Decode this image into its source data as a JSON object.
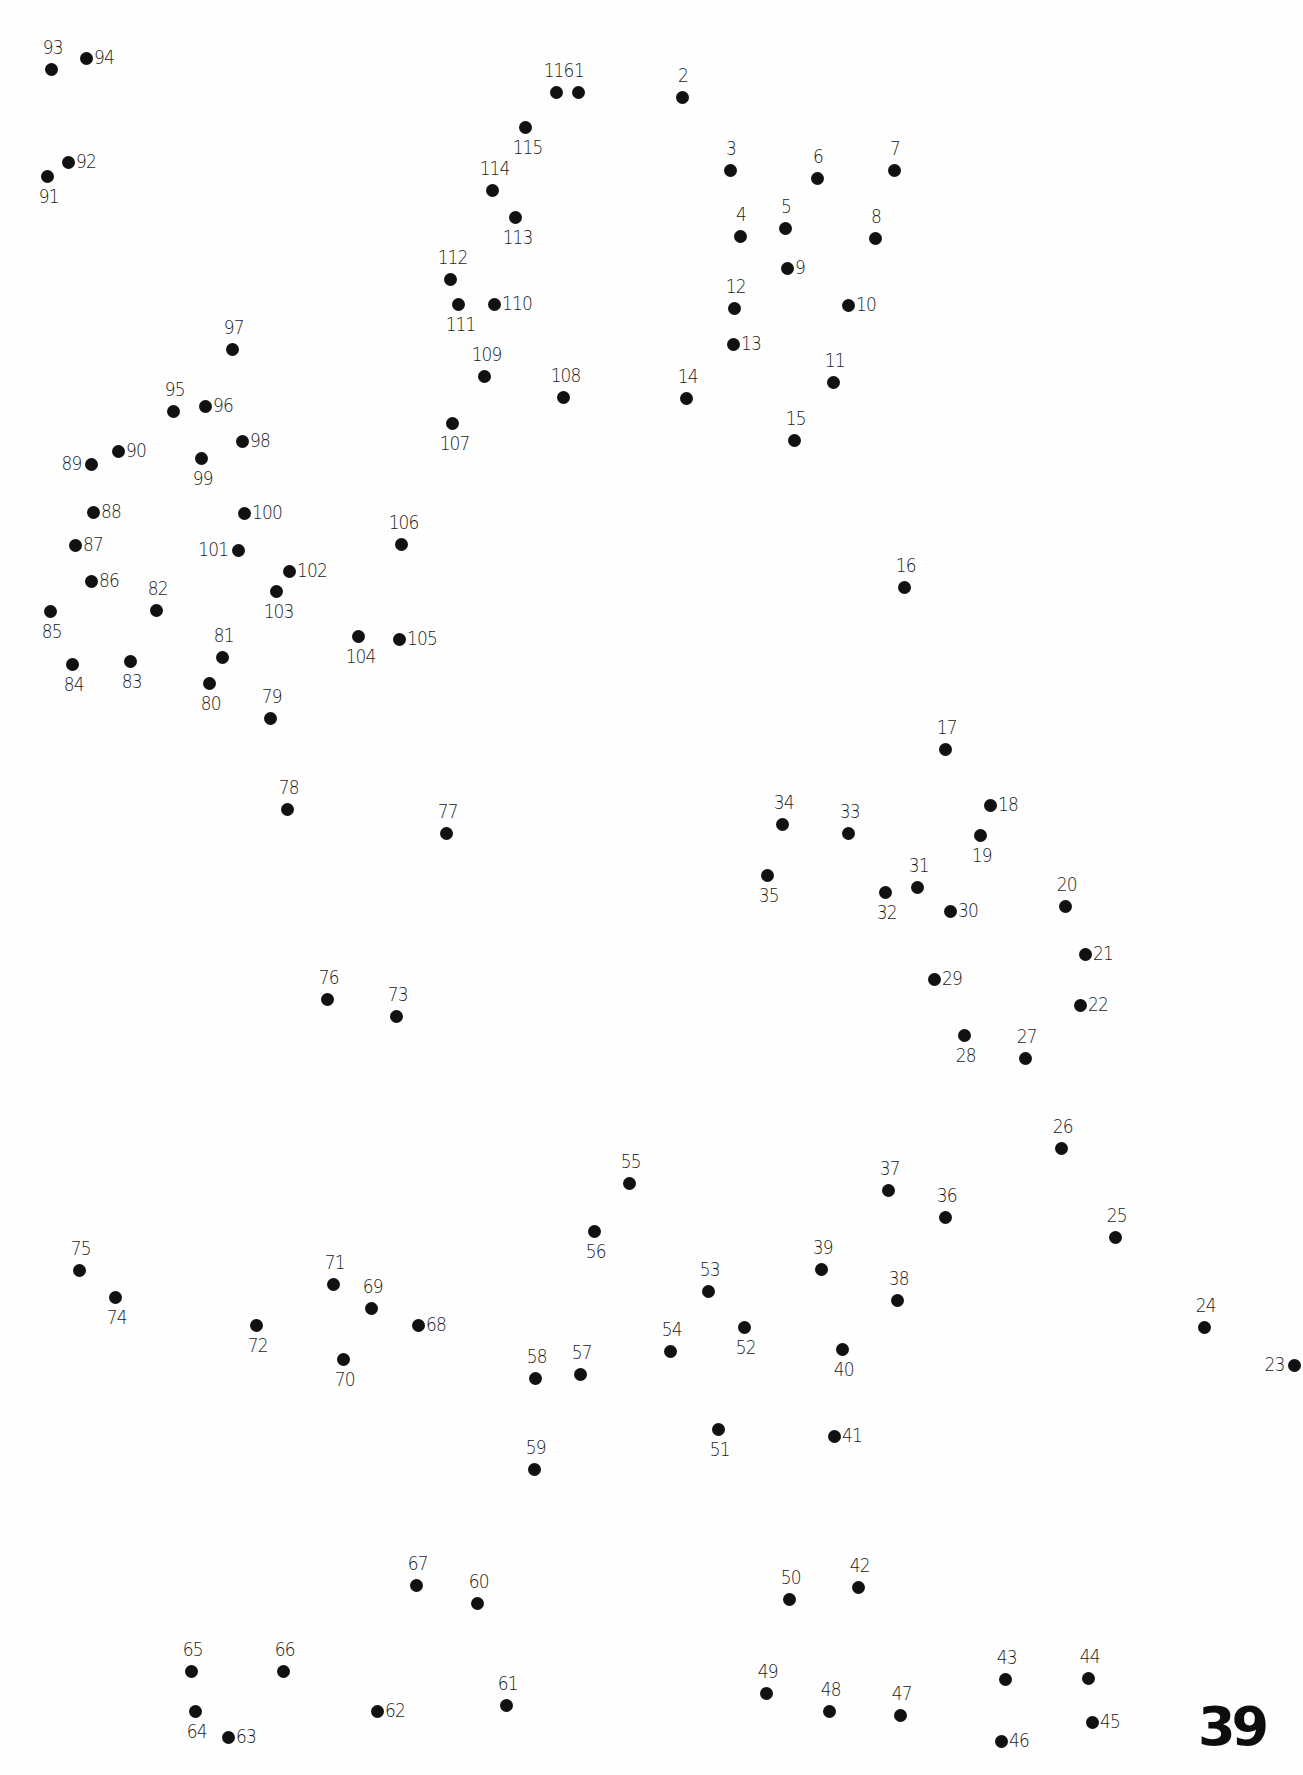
{
  "puzzle": {
    "type": "connect-the-dots",
    "page_number": "39",
    "dot_color": "#111111",
    "background_color": "#fefefe",
    "dots": [
      {
        "n": "1",
        "x": 578,
        "y": 92,
        "label_pos": "above"
      },
      {
        "n": "2",
        "x": 682,
        "y": 97,
        "label_pos": "above"
      },
      {
        "n": "3",
        "x": 730,
        "y": 170,
        "label_pos": "above"
      },
      {
        "n": "4",
        "x": 740,
        "y": 236,
        "label_pos": "above"
      },
      {
        "n": "5",
        "x": 785,
        "y": 228,
        "label_pos": "above"
      },
      {
        "n": "6",
        "x": 817,
        "y": 178,
        "label_pos": "above"
      },
      {
        "n": "7",
        "x": 894,
        "y": 170,
        "label_pos": "above"
      },
      {
        "n": "8",
        "x": 875,
        "y": 238,
        "label_pos": "above"
      },
      {
        "n": "9",
        "x": 787,
        "y": 268,
        "label_pos": "right"
      },
      {
        "n": "10",
        "x": 848,
        "y": 305,
        "label_pos": "right"
      },
      {
        "n": "11",
        "x": 833,
        "y": 382,
        "label_pos": "above"
      },
      {
        "n": "12",
        "x": 734,
        "y": 308,
        "label_pos": "above"
      },
      {
        "n": "13",
        "x": 733,
        "y": 344,
        "label_pos": "right"
      },
      {
        "n": "14",
        "x": 686,
        "y": 398,
        "label_pos": "above"
      },
      {
        "n": "15",
        "x": 794,
        "y": 440,
        "label_pos": "above"
      },
      {
        "n": "16",
        "x": 904,
        "y": 587,
        "label_pos": "above"
      },
      {
        "n": "17",
        "x": 945,
        "y": 749,
        "label_pos": "above"
      },
      {
        "n": "18",
        "x": 990,
        "y": 805,
        "label_pos": "right"
      },
      {
        "n": "19",
        "x": 980,
        "y": 835,
        "label_pos": "below"
      },
      {
        "n": "20",
        "x": 1065,
        "y": 906,
        "label_pos": "above"
      },
      {
        "n": "21",
        "x": 1085,
        "y": 954,
        "label_pos": "right"
      },
      {
        "n": "22",
        "x": 1080,
        "y": 1005,
        "label_pos": "right"
      },
      {
        "n": "23",
        "x": 1294,
        "y": 1365,
        "label_pos": "left"
      },
      {
        "n": "24",
        "x": 1204,
        "y": 1327,
        "label_pos": "above"
      },
      {
        "n": "25",
        "x": 1115,
        "y": 1237,
        "label_pos": "above"
      },
      {
        "n": "26",
        "x": 1061,
        "y": 1148,
        "label_pos": "above"
      },
      {
        "n": "27",
        "x": 1025,
        "y": 1058,
        "label_pos": "above"
      },
      {
        "n": "28",
        "x": 964,
        "y": 1035,
        "label_pos": "below"
      },
      {
        "n": "29",
        "x": 934,
        "y": 979,
        "label_pos": "right"
      },
      {
        "n": "30",
        "x": 950,
        "y": 911,
        "label_pos": "right"
      },
      {
        "n": "31",
        "x": 917,
        "y": 887,
        "label_pos": "above"
      },
      {
        "n": "32",
        "x": 885,
        "y": 892,
        "label_pos": "below"
      },
      {
        "n": "33",
        "x": 848,
        "y": 833,
        "label_pos": "above"
      },
      {
        "n": "34",
        "x": 782,
        "y": 824,
        "label_pos": "above"
      },
      {
        "n": "35",
        "x": 767,
        "y": 875,
        "label_pos": "below"
      },
      {
        "n": "36",
        "x": 945,
        "y": 1217,
        "label_pos": "above"
      },
      {
        "n": "37",
        "x": 888,
        "y": 1190,
        "label_pos": "above"
      },
      {
        "n": "38",
        "x": 897,
        "y": 1300,
        "label_pos": "above"
      },
      {
        "n": "39",
        "x": 821,
        "y": 1269,
        "label_pos": "above"
      },
      {
        "n": "40",
        "x": 842,
        "y": 1349,
        "label_pos": "below"
      },
      {
        "n": "41",
        "x": 834,
        "y": 1436,
        "label_pos": "right"
      },
      {
        "n": "42",
        "x": 858,
        "y": 1587,
        "label_pos": "above"
      },
      {
        "n": "43",
        "x": 1005,
        "y": 1679,
        "label_pos": "above"
      },
      {
        "n": "44",
        "x": 1088,
        "y": 1678,
        "label_pos": "above"
      },
      {
        "n": "45",
        "x": 1092,
        "y": 1722,
        "label_pos": "right"
      },
      {
        "n": "46",
        "x": 1001,
        "y": 1741,
        "label_pos": "right"
      },
      {
        "n": "47",
        "x": 900,
        "y": 1715,
        "label_pos": "above"
      },
      {
        "n": "48",
        "x": 829,
        "y": 1711,
        "label_pos": "above"
      },
      {
        "n": "49",
        "x": 766,
        "y": 1693,
        "label_pos": "above"
      },
      {
        "n": "50",
        "x": 789,
        "y": 1599,
        "label_pos": "above"
      },
      {
        "n": "51",
        "x": 718,
        "y": 1429,
        "label_pos": "below"
      },
      {
        "n": "52",
        "x": 744,
        "y": 1327,
        "label_pos": "below"
      },
      {
        "n": "53",
        "x": 708,
        "y": 1291,
        "label_pos": "above"
      },
      {
        "n": "54",
        "x": 670,
        "y": 1351,
        "label_pos": "above"
      },
      {
        "n": "55",
        "x": 629,
        "y": 1183,
        "label_pos": "above"
      },
      {
        "n": "56",
        "x": 594,
        "y": 1231,
        "label_pos": "below"
      },
      {
        "n": "57",
        "x": 580,
        "y": 1374,
        "label_pos": "above"
      },
      {
        "n": "58",
        "x": 535,
        "y": 1378,
        "label_pos": "above"
      },
      {
        "n": "59",
        "x": 534,
        "y": 1469,
        "label_pos": "above"
      },
      {
        "n": "60",
        "x": 477,
        "y": 1603,
        "label_pos": "above"
      },
      {
        "n": "61",
        "x": 506,
        "y": 1705,
        "label_pos": "above"
      },
      {
        "n": "62",
        "x": 377,
        "y": 1711,
        "label_pos": "right"
      },
      {
        "n": "63",
        "x": 228,
        "y": 1737,
        "label_pos": "right"
      },
      {
        "n": "64",
        "x": 195,
        "y": 1711,
        "label_pos": "below"
      },
      {
        "n": "65",
        "x": 191,
        "y": 1671,
        "label_pos": "above"
      },
      {
        "n": "66",
        "x": 283,
        "y": 1671,
        "label_pos": "above"
      },
      {
        "n": "67",
        "x": 416,
        "y": 1585,
        "label_pos": "above"
      },
      {
        "n": "68",
        "x": 418,
        "y": 1325,
        "label_pos": "right"
      },
      {
        "n": "69",
        "x": 371,
        "y": 1308,
        "label_pos": "above"
      },
      {
        "n": "70",
        "x": 343,
        "y": 1359,
        "label_pos": "below"
      },
      {
        "n": "71",
        "x": 333,
        "y": 1284,
        "label_pos": "above"
      },
      {
        "n": "72",
        "x": 256,
        "y": 1325,
        "label_pos": "below"
      },
      {
        "n": "73",
        "x": 396,
        "y": 1016,
        "label_pos": "above"
      },
      {
        "n": "74",
        "x": 115,
        "y": 1297,
        "label_pos": "below"
      },
      {
        "n": "75",
        "x": 79,
        "y": 1270,
        "label_pos": "above"
      },
      {
        "n": "76",
        "x": 327,
        "y": 999,
        "label_pos": "above"
      },
      {
        "n": "77",
        "x": 446,
        "y": 833,
        "label_pos": "above"
      },
      {
        "n": "78",
        "x": 287,
        "y": 809,
        "label_pos": "above"
      },
      {
        "n": "79",
        "x": 270,
        "y": 718,
        "label_pos": "above"
      },
      {
        "n": "80",
        "x": 209,
        "y": 683,
        "label_pos": "below"
      },
      {
        "n": "81",
        "x": 222,
        "y": 657,
        "label_pos": "above"
      },
      {
        "n": "82",
        "x": 156,
        "y": 610,
        "label_pos": "above"
      },
      {
        "n": "83",
        "x": 130,
        "y": 661,
        "label_pos": "below"
      },
      {
        "n": "84",
        "x": 72,
        "y": 664,
        "label_pos": "below"
      },
      {
        "n": "85",
        "x": 50,
        "y": 611,
        "label_pos": "below"
      },
      {
        "n": "86",
        "x": 91,
        "y": 581,
        "label_pos": "right"
      },
      {
        "n": "87",
        "x": 75,
        "y": 545,
        "label_pos": "right"
      },
      {
        "n": "88",
        "x": 93,
        "y": 512,
        "label_pos": "right"
      },
      {
        "n": "89",
        "x": 91,
        "y": 464,
        "label_pos": "left"
      },
      {
        "n": "90",
        "x": 118,
        "y": 451,
        "label_pos": "right"
      },
      {
        "n": "91",
        "x": 47,
        "y": 176,
        "label_pos": "below"
      },
      {
        "n": "92",
        "x": 68,
        "y": 162,
        "label_pos": "right"
      },
      {
        "n": "93",
        "x": 51,
        "y": 69,
        "label_pos": "above"
      },
      {
        "n": "94",
        "x": 86,
        "y": 58,
        "label_pos": "right"
      },
      {
        "n": "95",
        "x": 173,
        "y": 411,
        "label_pos": "above"
      },
      {
        "n": "96",
        "x": 205,
        "y": 406,
        "label_pos": "right"
      },
      {
        "n": "97",
        "x": 232,
        "y": 349,
        "label_pos": "above"
      },
      {
        "n": "98",
        "x": 242,
        "y": 441,
        "label_pos": "right"
      },
      {
        "n": "99",
        "x": 201,
        "y": 458,
        "label_pos": "below"
      },
      {
        "n": "100",
        "x": 244,
        "y": 513,
        "label_pos": "right"
      },
      {
        "n": "101",
        "x": 238,
        "y": 550,
        "label_pos": "left"
      },
      {
        "n": "102",
        "x": 289,
        "y": 571,
        "label_pos": "right"
      },
      {
        "n": "103",
        "x": 276,
        "y": 591,
        "label_pos": "below"
      },
      {
        "n": "104",
        "x": 358,
        "y": 636,
        "label_pos": "below"
      },
      {
        "n": "105",
        "x": 399,
        "y": 639,
        "label_pos": "right"
      },
      {
        "n": "106",
        "x": 401,
        "y": 544,
        "label_pos": "above"
      },
      {
        "n": "107",
        "x": 452,
        "y": 423,
        "label_pos": "below"
      },
      {
        "n": "108",
        "x": 563,
        "y": 397,
        "label_pos": "above"
      },
      {
        "n": "109",
        "x": 484,
        "y": 376,
        "label_pos": "above"
      },
      {
        "n": "110",
        "x": 494,
        "y": 304,
        "label_pos": "right"
      },
      {
        "n": "111",
        "x": 458,
        "y": 304,
        "label_pos": "below"
      },
      {
        "n": "112",
        "x": 450,
        "y": 279,
        "label_pos": "above"
      },
      {
        "n": "113",
        "x": 515,
        "y": 217,
        "label_pos": "below"
      },
      {
        "n": "114",
        "x": 492,
        "y": 190,
        "label_pos": "above"
      },
      {
        "n": "115",
        "x": 525,
        "y": 127,
        "label_pos": "below"
      },
      {
        "n": "116",
        "x": 556,
        "y": 92,
        "label_pos": "above"
      }
    ]
  }
}
